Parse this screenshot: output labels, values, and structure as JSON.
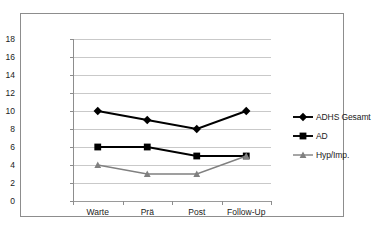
{
  "chart_data": {
    "type": "line",
    "title": "",
    "xlabel": "",
    "ylabel": "",
    "categories": [
      "Warte",
      "Prä",
      "Post",
      "Follow-Up"
    ],
    "ylim": [
      0,
      18
    ],
    "ytick_values": [
      0,
      2,
      4,
      6,
      8,
      10,
      12,
      14,
      16,
      18
    ],
    "ytick_labels": [
      "0",
      "2",
      "4",
      "6",
      "8",
      "10",
      "12",
      "14",
      "16",
      "18"
    ],
    "grid": true,
    "legend_position": "right",
    "series": [
      {
        "name": "ADHS Gesamt",
        "values": [
          10,
          9,
          8,
          10
        ],
        "color": "#000000",
        "marker": "diamond"
      },
      {
        "name": "AD",
        "values": [
          6,
          6,
          5,
          5
        ],
        "color": "#000000",
        "marker": "square"
      },
      {
        "name": "Hyp/Imp.",
        "values": [
          4,
          3,
          3,
          5
        ],
        "color": "#808080",
        "marker": "triangle"
      }
    ]
  },
  "legend": {
    "items": [
      {
        "label": "ADHS Gesamt"
      },
      {
        "label": "AD"
      },
      {
        "label": "Hyp/Imp."
      }
    ]
  }
}
